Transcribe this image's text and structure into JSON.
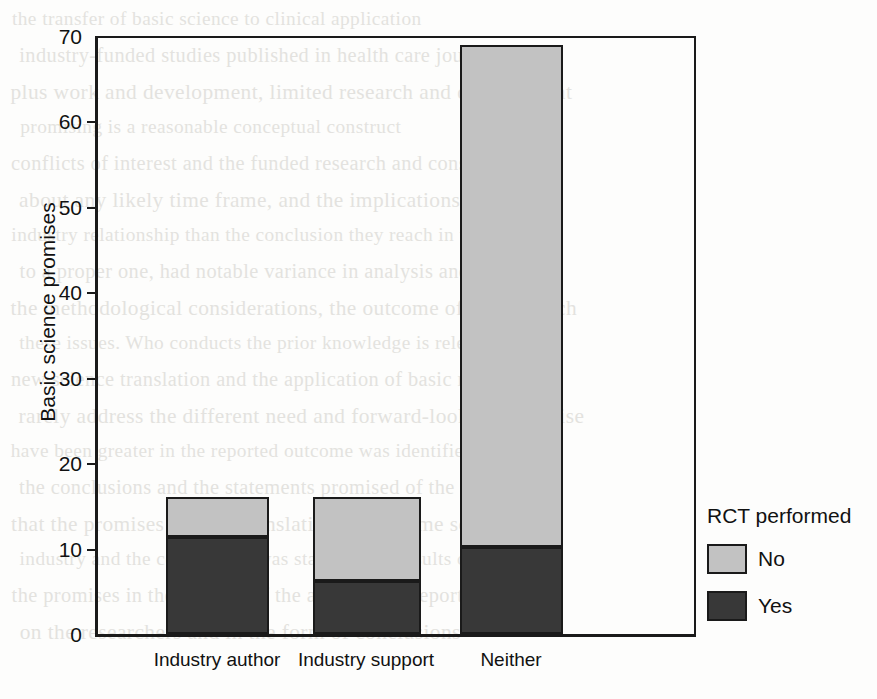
{
  "chart_data": {
    "type": "bar",
    "title": "",
    "xlabel": "",
    "ylabel": "Basic science promises",
    "ylim": [
      0,
      70
    ],
    "yticks": [
      0,
      10,
      20,
      30,
      40,
      50,
      60,
      70
    ],
    "grid": false,
    "stacked": true,
    "legend_title": "RCT performed",
    "legend_position": "right",
    "categories": [
      "Industry author",
      "Industry support",
      "Neither"
    ],
    "series": [
      {
        "name": "Yes",
        "color": "#383838",
        "values": [
          11.3,
          6.2,
          10.2
        ]
      },
      {
        "name": "No",
        "color": "#c2c2c2",
        "values": [
          4.7,
          9.8,
          58.8
        ]
      }
    ],
    "totals": [
      16,
      16,
      69
    ]
  },
  "axes": {
    "y_title": "Basic science promises",
    "y_ticks": [
      "70",
      "60",
      "50",
      "40",
      "30",
      "20",
      "10",
      "0"
    ],
    "x_labels": [
      "Industry author",
      "Industry support",
      "Neither"
    ]
  },
  "legend": {
    "title": "RCT performed",
    "entries": [
      {
        "label": "No",
        "color": "#c2c2c2"
      },
      {
        "label": "Yes",
        "color": "#383838"
      }
    ]
  },
  "background_text": {
    "lines": [
      "the transfer of basic science to clinical application",
      "industry-funded studies published in health care journals",
      "plus work and development, limited research and development",
      "promising is a reasonable conceptual construct",
      "conflicts of interest and the funded research and consumer",
      "about any likely time frame, and the implications of the",
      "industry relationship than the conclusion they reach in the",
      "to a proper one, had notable variance in analysis and",
      "the methodological considerations, the outcome of the research",
      "these issues. Who conducts the prior knowledge is relevant",
      "new science translation and the application of basic research",
      "rarely address the different need and forward-looking expertise",
      "have been greater in the reported outcome was identified, whether",
      "the conclusions and the statements promised of the studies",
      "that the promises and the translation in the same science",
      "industry and the conclusions was stated in the results of",
      "the promises in the abstract of the articles that report",
      "on the researchers and in the form of conclusions"
    ]
  }
}
